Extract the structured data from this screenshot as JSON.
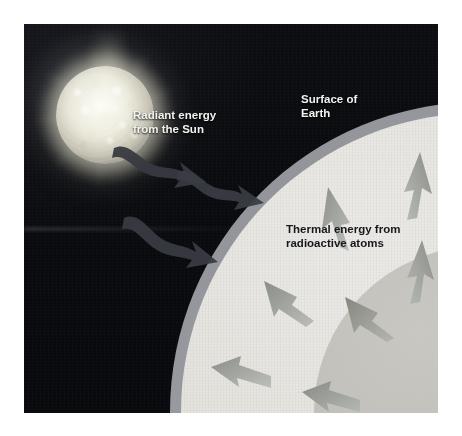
{
  "figure": {
    "background_color": "#0a0b0e",
    "frame_color": "#ffffff"
  },
  "labels": {
    "radiant": "Radiant energy\nfrom the Sun",
    "surface": "Surface of\nEarth",
    "thermal": "Thermal energy from\nradioactive atoms"
  },
  "sun": {
    "name": "sun",
    "core_color": "#f4f2e4",
    "glow_color": "#fffdf0"
  },
  "earth": {
    "layers": [
      {
        "name": "crust",
        "color": "#9a9ca2"
      },
      {
        "name": "mantle",
        "color": "#e4e2dd"
      },
      {
        "name": "outer-core",
        "color": "#c0beb9"
      },
      {
        "name": "inner-core",
        "color": "#a09e99"
      }
    ]
  },
  "arrows": {
    "solar_color": "#34363d",
    "internal_color": "#9d9f9b",
    "solar": [
      {
        "name": "solar-arrow-1"
      },
      {
        "name": "solar-arrow-2"
      },
      {
        "name": "solar-arrow-3"
      }
    ],
    "internal": [
      {
        "name": "internal-arrow-1"
      },
      {
        "name": "internal-arrow-2"
      },
      {
        "name": "internal-arrow-3"
      },
      {
        "name": "internal-arrow-4"
      },
      {
        "name": "internal-arrow-5"
      },
      {
        "name": "internal-arrow-6"
      },
      {
        "name": "internal-arrow-7"
      }
    ]
  }
}
